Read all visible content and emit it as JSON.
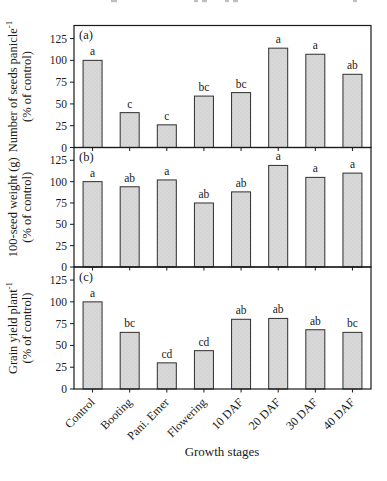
{
  "figure": {
    "xlabel": "Growth stages",
    "colors": {
      "bar_fill": "#d8d8d8",
      "bar_dot": "#c6c6c6",
      "bar_stroke": "#2f2f2f",
      "frame": "#1a1a1a",
      "text": "#1a1a1a"
    },
    "top_fragments": [
      {
        "x": 111,
        "w": 6
      },
      {
        "x": 194,
        "w": 4
      },
      {
        "x": 202,
        "w": 5
      },
      {
        "x": 225,
        "w": 4
      },
      {
        "x": 233,
        "w": 5
      },
      {
        "x": 353,
        "w": 4
      }
    ]
  },
  "chart_data": [
    {
      "type": "bar",
      "panel": "(a)",
      "categories": [
        "Control",
        "Booting",
        "Pani. Emer",
        "Flowering",
        "10 DAF",
        "20 DAF",
        "30 DAF",
        "40 DAF"
      ],
      "values": [
        100,
        40,
        26,
        59,
        63,
        114,
        107,
        84
      ],
      "sig_letters": [
        "a",
        "c",
        "c",
        "bc",
        "bc",
        "a",
        "a",
        "ab"
      ],
      "ylabel": "Number of seeds panicle⁻¹ (% of control)",
      "ylabel_main": "Number of seeds panicle",
      "ylabel_sup": "-1",
      "ylabel_line2": "(% of control)",
      "xlabel": "",
      "ylim": [
        0,
        140
      ],
      "yticks": [
        0,
        25,
        50,
        75,
        100,
        125
      ]
    },
    {
      "type": "bar",
      "panel": "(b)",
      "categories": [
        "Control",
        "Booting",
        "Pani. Emer",
        "Flowering",
        "10 DAF",
        "20 DAF",
        "30 DAF",
        "40 DAF"
      ],
      "values": [
        100,
        94,
        102,
        75,
        88,
        119,
        105,
        110
      ],
      "sig_letters": [
        "a",
        "ab",
        "a",
        "ab",
        "ab",
        "a",
        "a",
        "a"
      ],
      "ylabel": "100-seed weight (g) (% of control)",
      "ylabel_main": "100-seed weight (g)",
      "ylabel_sup": "",
      "ylabel_line2": "(% of control)",
      "xlabel": "",
      "ylim": [
        0,
        140
      ],
      "yticks": [
        0,
        25,
        50,
        75,
        100,
        125
      ]
    },
    {
      "type": "bar",
      "panel": "(c)",
      "categories": [
        "Control",
        "Booting",
        "Pani. Emer",
        "Flowering",
        "10 DAF",
        "20 DAF",
        "30 DAF",
        "40 DAF"
      ],
      "values": [
        100,
        65,
        30,
        44,
        80,
        81,
        68,
        65
      ],
      "sig_letters": [
        "a",
        "bc",
        "cd",
        "cd",
        "ab",
        "ab",
        "ab",
        "bc"
      ],
      "ylabel": "Grain yield plant⁻¹ (% of control)",
      "ylabel_main": "Grain yield plant",
      "ylabel_sup": "-1",
      "ylabel_line2": "(% of control)",
      "xlabel": "Growth stages",
      "ylim": [
        0,
        140
      ],
      "yticks": [
        0,
        25,
        50,
        75,
        100,
        125
      ]
    }
  ]
}
